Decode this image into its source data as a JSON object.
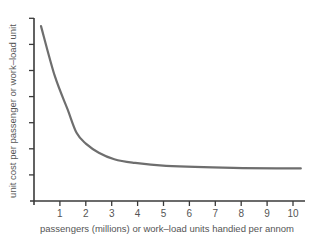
{
  "chart_data": {
    "type": "line",
    "title": "",
    "xlabel": "passengers (millions) or work–load units handied per annom",
    "ylabel": "unit cost per passenger or work–load unit",
    "x_ticks": [
      "1",
      "2",
      "3",
      "4",
      "5",
      "6",
      "7",
      "8",
      "9",
      "10"
    ],
    "xlim": [
      0,
      10.5
    ],
    "y_ticks_count": 7,
    "y_tick_labels": [],
    "grid": false,
    "legend": null,
    "series": [
      {
        "name": "unit cost",
        "color": "#6e6e6e",
        "x": [
          0.27,
          0.8,
          1.3,
          1.65,
          2.0,
          2.5,
          3.1,
          3.8,
          5.1,
          7.7,
          10.3
        ],
        "y": [
          6.7,
          4.8,
          3.5,
          2.6,
          2.2,
          1.85,
          1.6,
          1.47,
          1.35,
          1.27,
          1.25
        ],
        "note": "relative values; y-axis unlabeled (tick units)"
      }
    ]
  },
  "axes": {
    "color": "#3a3a3a"
  }
}
